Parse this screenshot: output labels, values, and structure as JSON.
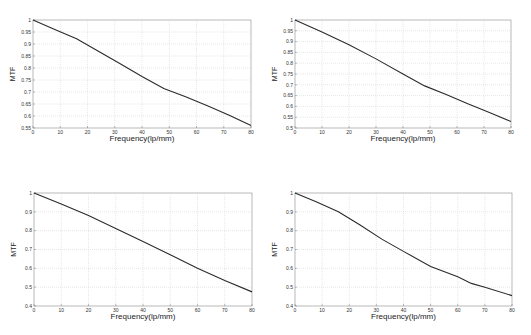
{
  "chart_data": [
    {
      "type": "line",
      "title": "",
      "xlabel": "Frequency(lp/mm)",
      "ylabel": "MTF",
      "xlim": [
        0,
        80
      ],
      "ylim": [
        0.55,
        1
      ],
      "xticks": [
        0,
        10,
        20,
        30,
        40,
        50,
        60,
        70,
        80
      ],
      "yticks": [
        0.55,
        0.6,
        0.65,
        0.7,
        0.75,
        0.8,
        0.85,
        0.9,
        0.95,
        1
      ],
      "ytick_labels": [
        "0.55",
        "0.6",
        "0.65",
        "0.7",
        "0.75",
        "0.8",
        "0.85",
        "0.9",
        "0.95",
        "1"
      ],
      "grid": true,
      "series": [
        {
          "name": "MTF",
          "x": [
            0,
            8,
            16,
            24,
            32,
            40,
            48,
            56,
            64,
            72,
            80
          ],
          "y": [
            1.0,
            0.96,
            0.922,
            0.87,
            0.818,
            0.765,
            0.715,
            0.68,
            0.643,
            0.603,
            0.56
          ]
        }
      ]
    },
    {
      "type": "line",
      "title": "",
      "xlabel": "Frequency(lp/mm)",
      "ylabel": "MTF",
      "xlim": [
        0,
        80
      ],
      "ylim": [
        0.5,
        1
      ],
      "xticks": [
        0,
        10,
        20,
        30,
        40,
        50,
        60,
        70,
        80
      ],
      "yticks": [
        0.5,
        0.55,
        0.6,
        0.65,
        0.7,
        0.75,
        0.8,
        0.85,
        0.9,
        0.95,
        1
      ],
      "ytick_labels": [
        "0.5",
        "0.55",
        "0.6",
        "0.65",
        "0.7",
        "0.75",
        "0.8",
        "0.85",
        "0.9",
        "0.95",
        "1"
      ],
      "grid": true,
      "series": [
        {
          "name": "MTF",
          "x": [
            0,
            10,
            20,
            30,
            40,
            48,
            56,
            64,
            72,
            80
          ],
          "y": [
            1.0,
            0.945,
            0.885,
            0.82,
            0.75,
            0.695,
            0.655,
            0.612,
            0.572,
            0.53
          ]
        }
      ]
    },
    {
      "type": "line",
      "title": "",
      "xlabel": "Frequency(lp/mm)",
      "ylabel": "MTF",
      "xlim": [
        0,
        80
      ],
      "ylim": [
        0.4,
        1
      ],
      "xticks": [
        0,
        10,
        20,
        30,
        40,
        50,
        60,
        70,
        80
      ],
      "yticks": [
        0.4,
        0.5,
        0.6,
        0.7,
        0.8,
        0.9,
        1
      ],
      "ytick_labels": [
        "0.4",
        "0.5",
        "0.6",
        "0.7",
        "0.8",
        "0.9",
        "1"
      ],
      "grid": true,
      "series": [
        {
          "name": "MTF",
          "x": [
            0,
            10,
            20,
            30,
            40,
            50,
            60,
            70,
            80
          ],
          "y": [
            1.0,
            0.942,
            0.88,
            0.812,
            0.743,
            0.672,
            0.6,
            0.535,
            0.475
          ]
        }
      ]
    },
    {
      "type": "line",
      "title": "",
      "xlabel": "Frequency(lp/mm)",
      "ylabel": "MTF",
      "xlim": [
        0,
        80
      ],
      "ylim": [
        0.4,
        1
      ],
      "xticks": [
        0,
        10,
        20,
        30,
        40,
        50,
        60,
        70,
        80
      ],
      "yticks": [
        0.4,
        0.5,
        0.6,
        0.7,
        0.8,
        0.9,
        1
      ],
      "ytick_labels": [
        "0.4",
        "0.5",
        "0.6",
        "0.7",
        "0.8",
        "0.9",
        "1"
      ],
      "grid": true,
      "series": [
        {
          "name": "MTF",
          "x": [
            0,
            8,
            16,
            24,
            32,
            40,
            50,
            60,
            65,
            70,
            80
          ],
          "y": [
            1.0,
            0.952,
            0.9,
            0.83,
            0.755,
            0.69,
            0.61,
            0.555,
            0.52,
            0.5,
            0.455
          ]
        }
      ]
    }
  ]
}
